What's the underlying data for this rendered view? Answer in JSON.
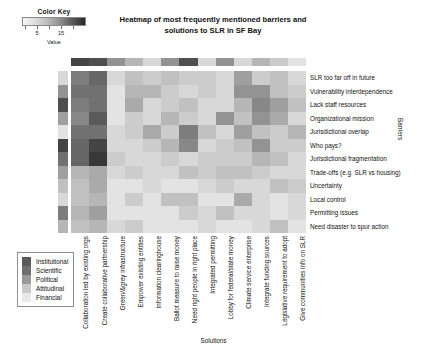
{
  "title": "Heatmap of most frequently mentioned barriers and solutions to SLR in SF Bay",
  "color_key": {
    "title": "Color Key",
    "axis_label": "Value",
    "ticks": [
      "5",
      "15"
    ],
    "tick_values": [
      5,
      15
    ],
    "gradient_low": "#f7f7f7",
    "gradient_high": "#1f1f1f"
  },
  "axes": {
    "x_title": "Solutions",
    "y_title": "Barriers"
  },
  "category_legend": {
    "items": [
      {
        "label": "Institutional",
        "color": "#5a5a5a"
      },
      {
        "label": "Scientific",
        "color": "#6f6f6f"
      },
      {
        "label": "Political",
        "color": "#9a9a9a"
      },
      {
        "label": "Attitudinal",
        "color": "#c9c9c9"
      },
      {
        "label": "Financial",
        "color": "#e8e8e8"
      }
    ]
  },
  "chart_data": {
    "type": "heatmap",
    "title": "Heatmap of most frequently mentioned barriers and solutions to SLR in SF Bay",
    "xlabel": "Solutions",
    "ylabel": "Barriers",
    "colorbar_label": "Value",
    "zlim": [
      0,
      20
    ],
    "grid": false,
    "legend_position": "bottom-left",
    "colormap": "grayscale-reversed",
    "columns": [
      "Collaboration led by existing orgs",
      "Create collaborative partnership",
      "Green/&grey infrastructure",
      "Empower existing entities",
      "Information clearinghouse",
      "Ballot measure to raise money",
      "Need right people in right place",
      "Integrated permitting",
      "Lobby for federal/state money",
      "Climate service enterprise",
      "Integrate funding sources",
      "Legislative requirement to adopt",
      "Give communities info on SLR",
      "Include community-based orgs"
    ],
    "rows": [
      "SLR too far off in future",
      "Vulnerability interdependence",
      "Lack staff resources",
      "Organizational mission",
      "Jurisdictional overlap",
      "Who pays?",
      "Jurisdictional fragmentation",
      "Trade-offs (e.g. SLR vs housing)",
      "Uncertainty",
      "Local control",
      "Permitting issues",
      "Need disaster to spur action"
    ],
    "column_annotation_values": [
      16,
      15,
      9,
      6,
      3,
      9,
      15,
      3,
      9,
      3,
      6,
      4,
      2
    ],
    "row_annotation_values": [
      3,
      9,
      15,
      8,
      2,
      16,
      12,
      8,
      5,
      3,
      11,
      6
    ],
    "values": [
      [
        11,
        13,
        3,
        5,
        4,
        5,
        4,
        4,
        3,
        8,
        4,
        5,
        3
      ],
      [
        12,
        12,
        2,
        6,
        6,
        4,
        3,
        4,
        3,
        9,
        9,
        5,
        4
      ],
      [
        11,
        12,
        2,
        7,
        3,
        4,
        5,
        3,
        3,
        6,
        10,
        8,
        5
      ],
      [
        10,
        14,
        2,
        4,
        3,
        6,
        4,
        3,
        9,
        5,
        9,
        7,
        3
      ],
      [
        12,
        12,
        3,
        4,
        7,
        4,
        11,
        5,
        3,
        8,
        5,
        4,
        6
      ],
      [
        13,
        16,
        3,
        3,
        4,
        6,
        10,
        3,
        4,
        5,
        9,
        4,
        4
      ],
      [
        13,
        17,
        4,
        3,
        3,
        4,
        3,
        4,
        4,
        4,
        6,
        5,
        3
      ],
      [
        6,
        7,
        3,
        4,
        3,
        3,
        5,
        4,
        5,
        5,
        4,
        3,
        3
      ],
      [
        5,
        7,
        2,
        2,
        3,
        2,
        2,
        3,
        4,
        3,
        3,
        5,
        4
      ],
      [
        5,
        6,
        2,
        4,
        2,
        5,
        5,
        2,
        2,
        7,
        3,
        2,
        3
      ],
      [
        6,
        8,
        2,
        2,
        2,
        2,
        4,
        3,
        5,
        3,
        3,
        2,
        3
      ],
      [
        5,
        6,
        3,
        4,
        2,
        2,
        2,
        3,
        2,
        2,
        3,
        5,
        2
      ]
    ]
  }
}
